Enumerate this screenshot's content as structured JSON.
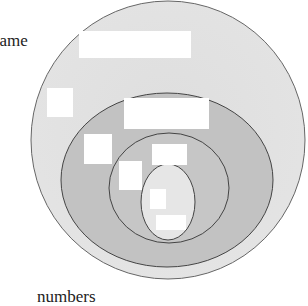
{
  "diagram": {
    "type": "nested-euler-diagram",
    "labels": {
      "name": "name",
      "numbers": "numbers"
    },
    "colors": {
      "background": "#ffffff",
      "outer_fill": "#e2e2e2",
      "second_fill": "#c4c4c4",
      "third_fill": "#c8c8c8",
      "inner_fill": "#e6e6e6",
      "stroke": "#555555",
      "placeholder": "#ffffff"
    },
    "sets": [
      {
        "id": "outer",
        "level": 1
      },
      {
        "id": "second",
        "level": 2
      },
      {
        "id": "third",
        "level": 3
      },
      {
        "id": "inner",
        "level": 4
      }
    ],
    "placeholders": [
      {
        "id": "outer-top-label"
      },
      {
        "id": "outer-left-label"
      },
      {
        "id": "second-top-label"
      },
      {
        "id": "second-left-label"
      },
      {
        "id": "third-top-label"
      },
      {
        "id": "third-left-label"
      },
      {
        "id": "inner-top-label"
      },
      {
        "id": "inner-bottom-label"
      }
    ]
  }
}
